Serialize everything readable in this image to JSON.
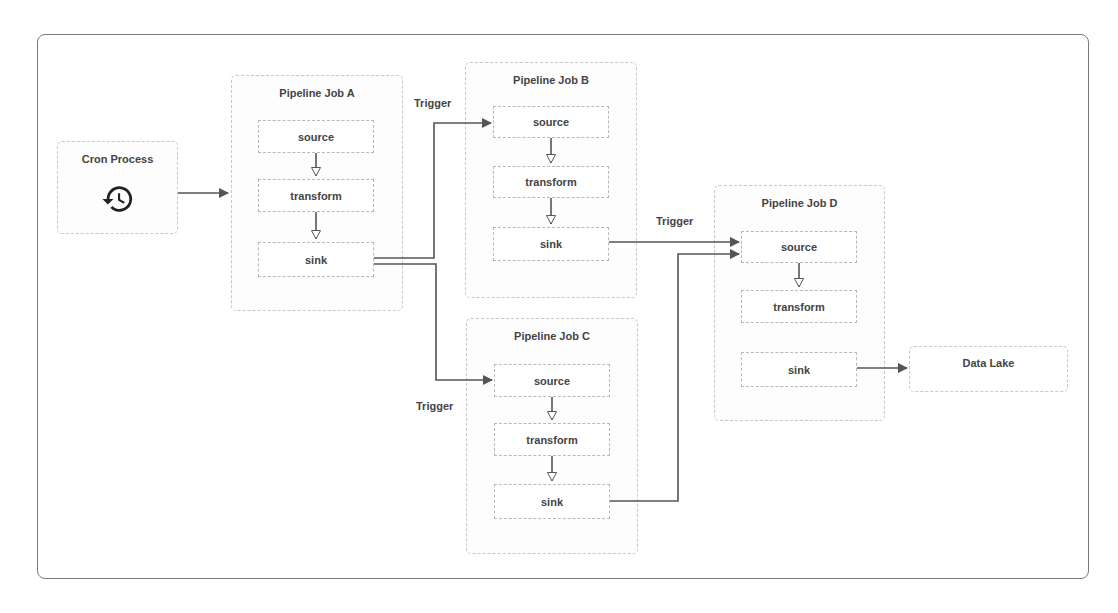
{
  "diagram": {
    "title": "",
    "cron": {
      "title": "Cron Process",
      "icon": "history-clock-icon"
    },
    "jobs": [
      {
        "id": "A",
        "title": "Pipeline Job A",
        "stages": [
          "source",
          "transform",
          "sink"
        ]
      },
      {
        "id": "B",
        "title": "Pipeline Job B",
        "stages": [
          "source",
          "transform",
          "sink"
        ]
      },
      {
        "id": "C",
        "title": "Pipeline Job C",
        "stages": [
          "source",
          "transform",
          "sink"
        ]
      },
      {
        "id": "D",
        "title": "Pipeline Job D",
        "stages": [
          "source",
          "transform",
          "sink"
        ]
      }
    ],
    "data_lake": {
      "title": "Data Lake"
    },
    "edge_labels": {
      "a_to_b": "Trigger",
      "a_to_c": "Trigger",
      "b_to_d": "Trigger"
    },
    "edges": [
      {
        "from": "Cron Process",
        "to": "Pipeline Job A"
      },
      {
        "from": "Pipeline Job A.sink",
        "to": "Pipeline Job B.source",
        "label": "Trigger"
      },
      {
        "from": "Pipeline Job A.sink",
        "to": "Pipeline Job C.source",
        "label": "Trigger"
      },
      {
        "from": "Pipeline Job B.sink",
        "to": "Pipeline Job D.source",
        "label": "Trigger"
      },
      {
        "from": "Pipeline Job C.sink",
        "to": "Pipeline Job D.source"
      },
      {
        "from": "Pipeline Job D.sink",
        "to": "Data Lake"
      }
    ],
    "colors": {
      "border": "#c8c8c8",
      "line": "#555555",
      "text": "#444444",
      "frame": "#7a7a7a"
    }
  }
}
